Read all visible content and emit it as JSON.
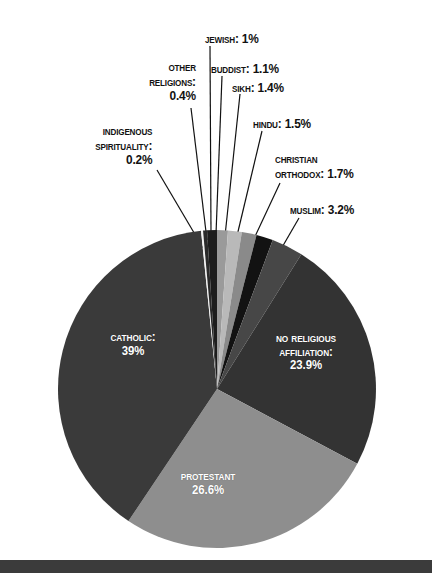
{
  "chart_data": {
    "type": "pie",
    "title": "",
    "subtitle": "",
    "xlabel": "",
    "ylabel": "",
    "legend_position": "none",
    "grid": false,
    "units": "percent",
    "categories": [
      "No religious affiliation",
      "Protestant",
      "Catholic",
      "Indigenous spirituality",
      "Other religions",
      "Jewish",
      "Buddist",
      "Sikh",
      "Hindu",
      "Christian Orthodox",
      "Muslim"
    ],
    "values": [
      23.9,
      26.6,
      39,
      0.2,
      0.4,
      1,
      1.1,
      1.4,
      1.5,
      1.7,
      3.2
    ],
    "slices": [
      {
        "name": "no-religious-affiliation",
        "label": "No religious\naffiliation:\n23.9%",
        "value": 23.9,
        "value_text": "23.9%",
        "color": "#333333",
        "label_placement": "inside",
        "label_x": 306,
        "label_y": 332
      },
      {
        "name": "protestant",
        "label": "Protestant\n26.6%",
        "value": 26.6,
        "value_text": "26.6%",
        "color": "#8e8e8e",
        "label_placement": "inside",
        "label_x": 208,
        "label_y": 470
      },
      {
        "name": "catholic",
        "label": "Catholic:\n39%",
        "value": 39,
        "value_text": "39%",
        "color": "#3a3a3a",
        "label_placement": "inside",
        "label_x": 133,
        "label_y": 331
      },
      {
        "name": "indigenous-spirituality",
        "label": "Indigenous\nSpirituality:\n0.2%",
        "value": 0.2,
        "value_text": "0.2%",
        "color": "#f2f2f2",
        "label_placement": "callout",
        "label_x": 152,
        "label_y": 124,
        "align": "right",
        "line": {
          "x1": 157,
          "y1": 170,
          "x2": 203,
          "y2": 248
        }
      },
      {
        "name": "other-religions",
        "label": "Other\nreligions:\n0.4%",
        "value": 0.4,
        "value_text": "0.4%",
        "color": "#2a2a2a",
        "label_placement": "callout",
        "label_x": 196,
        "label_y": 60,
        "align": "right",
        "line": {
          "x1": 191,
          "y1": 108,
          "x2": 207,
          "y2": 240
        }
      },
      {
        "name": "jewish",
        "label": "Jewish: 1%",
        "value": 1,
        "value_text": "1%",
        "color": "#1d1d1d",
        "label_placement": "callout",
        "label_x": 259,
        "label_y": 32,
        "align": "right",
        "line": {
          "x1": 210,
          "y1": 46,
          "x2": 211,
          "y2": 234
        }
      },
      {
        "name": "buddist",
        "label": "Buddist: 1.1%",
        "value": 1.1,
        "value_text": "1.1%",
        "color": "#9a9a9a",
        "label_placement": "callout",
        "label_x": 211,
        "label_y": 62,
        "align": "left",
        "line": {
          "x1": 222,
          "y1": 76,
          "x2": 216,
          "y2": 234
        }
      },
      {
        "name": "sikh",
        "label": "Sikh: 1.4%",
        "value": 1.4,
        "value_text": "1.4%",
        "color": "#b9b9b9",
        "label_placement": "callout",
        "label_x": 232,
        "label_y": 81,
        "align": "left",
        "line": {
          "x1": 240,
          "y1": 94,
          "x2": 225,
          "y2": 236
        }
      },
      {
        "name": "hindu",
        "label": "Hindu: 1.5%",
        "value": 1.5,
        "value_text": "1.5%",
        "color": "#8a8a8a",
        "label_placement": "callout",
        "label_x": 253,
        "label_y": 117,
        "align": "left",
        "line": {
          "x1": 262,
          "y1": 131,
          "x2": 236,
          "y2": 240
        }
      },
      {
        "name": "christian-orthodox",
        "label": "Christian\nOrthodox: 1.7%",
        "value": 1.7,
        "value_text": "1.7%",
        "color": "#121212",
        "label_placement": "callout",
        "label_x": 275,
        "label_y": 152,
        "align": "left",
        "line": {
          "x1": 280,
          "y1": 183,
          "x2": 251,
          "y2": 245
        }
      },
      {
        "name": "muslim",
        "label": "Muslim: 3.2%",
        "value": 3.2,
        "value_text": "3.2%",
        "color": "#474747",
        "label_placement": "callout",
        "label_x": 290,
        "label_y": 203,
        "align": "left",
        "line": {
          "x1": 299,
          "y1": 218,
          "x2": 277,
          "y2": 256
        }
      }
    ],
    "geometry": {
      "center_x": 217,
      "center_y": 389,
      "radius": 159,
      "start_angle_deg": -90,
      "direction": "clockwise"
    }
  },
  "figure": {
    "background_color": "#ffffff",
    "footer_bar_color": "#3b3b3b",
    "label_text_color": "#111111",
    "slice_label_text_color": "#ffffff"
  }
}
